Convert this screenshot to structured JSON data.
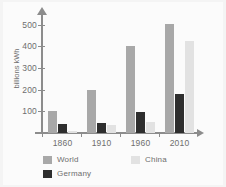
{
  "chart_data": {
    "type": "bar",
    "title": "",
    "xlabel": "",
    "ylabel": "billions kWh",
    "categories": [
      "1860",
      "1910",
      "1960",
      "2010"
    ],
    "series": [
      {
        "name": "World",
        "color": "#a8a8a8",
        "values": [
          100,
          197,
          400,
          505
        ]
      },
      {
        "name": "Germany",
        "color": "#2e2e2e",
        "values": [
          42,
          48,
          95,
          180
        ]
      },
      {
        "name": "China",
        "color": "#e2e2e2",
        "values": [
          8,
          38,
          52,
          425
        ]
      }
    ],
    "ylim": [
      0,
      540
    ],
    "yticks": [
      100,
      200,
      300,
      400,
      500
    ],
    "ytick_labels": [
      "100",
      "200",
      "300",
      "400",
      "500"
    ],
    "grid": false,
    "legend_position": "bottom-left",
    "legend_entries": [
      "World",
      "China",
      "Germany"
    ],
    "axis_color": "#8c8c8c",
    "text_color": "#6e6e6e",
    "background": "#fbfbfb"
  }
}
